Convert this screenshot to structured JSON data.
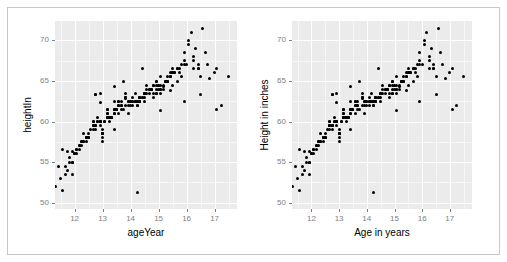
{
  "figure": {
    "background": "#ffffff",
    "frame_color": "#c8c8c8",
    "panel_fill": "#ebebeb",
    "gridline_color": "#ffffff",
    "point_color": "#000000",
    "tick_label_color": "#808080",
    "axis_title_color": "#000000"
  },
  "chart_data": [
    {
      "type": "scatter",
      "title": "",
      "xlabel": "ageYear",
      "ylabel": "heightIn",
      "xlim": [
        11.3,
        17.8
      ],
      "ylim": [
        49.2,
        72.4
      ],
      "xticks": [
        12,
        13,
        14,
        15,
        16,
        17
      ],
      "yticks": [
        50,
        55,
        60,
        65,
        70
      ],
      "grid": true,
      "legend": "none",
      "n_points": 236,
      "x": [
        11.92,
        12.92,
        12.75,
        13.42,
        15.92,
        14.25,
        15.42,
        11.92,
        13.17,
        11.33,
        13.42,
        12.67,
        11.75,
        11.58,
        13.25,
        15.17,
        13.83,
        12.92,
        16.83,
        16.5,
        11.58,
        13.42,
        17.08,
        17.08,
        12.75,
        13.75,
        14.33,
        14.58,
        15.08,
        14.33,
        13.83,
        14.83,
        15.33,
        14.42,
        13.58,
        13.92,
        15.92,
        14.17,
        11.42,
        14.17,
        13.0,
        14.5,
        15.42,
        12.33,
        12.42,
        14.58,
        13.83,
        15.5,
        12.75,
        13.42,
        14.92,
        16.42,
        15.33,
        15.08,
        15.92,
        11.83,
        12.67,
        17.0,
        12.83,
        12.92,
        13.17,
        14.25,
        13.0,
        13.5,
        15.5,
        11.75,
        12.92,
        13.67,
        14.75,
        11.5,
        12.25,
        13.42,
        12.17,
        15.25,
        14.5,
        13.92,
        16.75,
        14.0,
        12.67,
        11.92,
        15.58,
        13.17,
        13.58,
        14.33,
        14.92,
        11.67,
        14.08,
        13.33,
        15.08,
        12.5,
        12.33,
        13.25,
        13.0,
        16.5,
        11.83,
        14.92,
        13.67,
        16.25,
        12.42,
        12.0,
        13.83,
        13.17,
        14.83,
        13.5,
        13.17,
        11.67,
        15.25,
        14.33,
        14.5,
        12.17,
        13.42,
        14.67,
        13.0,
        15.75,
        12.83,
        12.5,
        13.25,
        12.75,
        12.25,
        12.83,
        13.92,
        12.08,
        13.58,
        12.75,
        12.92,
        15.42,
        13.83,
        12.67,
        15.33,
        12.08,
        14.33,
        14.17,
        15.08,
        13.0,
        12.5,
        14.75,
        15.5,
        13.33,
        13.08,
        11.92,
        12.67,
        13.42,
        13.58,
        14.5,
        12.42,
        12.75,
        13.17,
        12.5,
        15.83,
        14.92,
        13.92,
        14.08,
        16.08,
        12.42,
        14.17,
        15.67,
        16.17,
        13.42,
        14.0,
        14.33,
        15.25,
        13.25,
        12.92,
        16.0,
        15.0,
        14.58,
        13.67,
        14.75,
        15.67,
        16.33,
        12.25,
        13.5,
        14.08,
        15.5,
        12.0,
        14.25,
        16.67,
        15.0,
        14.83,
        13.17,
        14.42,
        15.08,
        12.58,
        13.83,
        14.67,
        15.92,
        12.33,
        13.0,
        14.25,
        15.17,
        16.42,
        17.5,
        12.67,
        13.75,
        14.92,
        15.75,
        16.25,
        12.17,
        13.08,
        14.0,
        14.92,
        15.58,
        13.33,
        14.42,
        15.33,
        16.58,
        12.08,
        13.25,
        14.08,
        15.0,
        15.83,
        12.92,
        13.67,
        14.67,
        15.42,
        16.08,
        13.58,
        14.5,
        15.17,
        16.25,
        12.42,
        13.17,
        14.25,
        15.08,
        15.67,
        13.0,
        14.83,
        15.5,
        16.42,
        17.25
      ],
      "y": [
        56.3,
        62.3,
        63.3,
        59.0,
        62.5,
        51.3,
        63.8,
        53.5,
        61.5,
        52.0,
        62.5,
        60.0,
        56.3,
        51.5,
        60.0,
        64.3,
        62.8,
        63.5,
        65.3,
        63.3,
        56.5,
        64.3,
        66.5,
        61.5,
        63.3,
        65.0,
        62.5,
        64.5,
        61.3,
        62.5,
        63.5,
        64.5,
        65.5,
        66.5,
        62.5,
        61.0,
        68.5,
        63.5,
        54.5,
        62.5,
        57.5,
        63.0,
        65.5,
        58.5,
        58.0,
        64.0,
        63.0,
        66.0,
        59.0,
        61.0,
        63.5,
        66.5,
        65.0,
        63.5,
        67.0,
        55.5,
        60.0,
        66.0,
        60.5,
        60.0,
        61.5,
        62.0,
        58.5,
        61.5,
        66.5,
        54.0,
        59.5,
        62.0,
        64.0,
        53.0,
        57.5,
        61.5,
        56.5,
        65.0,
        63.5,
        62.5,
        67.0,
        62.5,
        59.0,
        55.0,
        66.0,
        60.5,
        62.0,
        63.0,
        64.5,
        54.5,
        62.5,
        60.5,
        65.5,
        58.0,
        57.5,
        60.5,
        58.5,
        65.5,
        55.0,
        65.0,
        62.5,
        68.0,
        58.0,
        56.0,
        63.0,
        61.0,
        64.5,
        61.5,
        60.5,
        53.5,
        65.0,
        62.5,
        63.5,
        57.0,
        61.5,
        64.0,
        58.0,
        66.5,
        60.0,
        58.5,
        60.5,
        59.5,
        57.5,
        60.0,
        62.0,
        56.5,
        62.0,
        59.5,
        60.0,
        65.5,
        63.0,
        59.5,
        65.0,
        56.0,
        63.0,
        62.5,
        64.0,
        58.5,
        58.0,
        64.0,
        66.0,
        60.5,
        60.0,
        55.0,
        59.5,
        61.5,
        62.5,
        63.5,
        58.0,
        59.5,
        61.0,
        58.0,
        67.0,
        65.0,
        62.5,
        63.0,
        69.5,
        58.0,
        62.5,
        66.5,
        71.0,
        61.0,
        62.5,
        63.0,
        65.0,
        60.5,
        60.0,
        67.0,
        64.5,
        63.5,
        62.0,
        64.0,
        66.5,
        69.0,
        57.0,
        61.5,
        62.5,
        66.0,
        56.0,
        62.5,
        68.5,
        64.0,
        63.5,
        60.5,
        63.0,
        64.5,
        59.0,
        62.0,
        64.0,
        67.5,
        57.5,
        58.5,
        62.0,
        64.5,
        66.5,
        65.5,
        59.5,
        61.5,
        63.5,
        66.0,
        67.5,
        57.0,
        60.0,
        62.0,
        64.0,
        66.0,
        60.5,
        63.0,
        65.0,
        71.5,
        56.5,
        60.5,
        62.0,
        64.5,
        65.5,
        60.0,
        61.5,
        63.5,
        66.0,
        70.0,
        61.0,
        62.5,
        64.0,
        66.5,
        57.5,
        60.5,
        62.5,
        64.0,
        65.0,
        59.0,
        63.0,
        64.5,
        67.0,
        62.0
      ]
    },
    {
      "type": "scatter",
      "title": "",
      "xlabel": "Age in years",
      "ylabel": "Height in inches",
      "xlim": [
        11.3,
        17.8
      ],
      "ylim": [
        49.2,
        72.4
      ],
      "xticks": [
        12,
        13,
        14,
        15,
        16,
        17
      ],
      "yticks": [
        50,
        55,
        60,
        65,
        70
      ],
      "grid": true,
      "legend": "none",
      "n_points": 236,
      "same_data_as": 0
    }
  ]
}
